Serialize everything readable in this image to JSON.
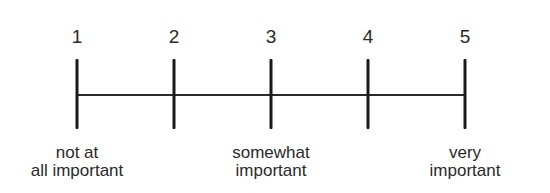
{
  "scale": {
    "points": [
      {
        "value": "1",
        "x": 77
      },
      {
        "value": "2",
        "x": 174
      },
      {
        "value": "3",
        "x": 271
      },
      {
        "value": "4",
        "x": 368
      },
      {
        "value": "5",
        "x": 465
      }
    ],
    "anchors": [
      {
        "line1": "not at",
        "line2": "all important",
        "x": 77
      },
      {
        "line1": "somewhat",
        "line2": "important",
        "x": 271
      },
      {
        "line1": "very",
        "line2": "important",
        "x": 465
      }
    ]
  }
}
